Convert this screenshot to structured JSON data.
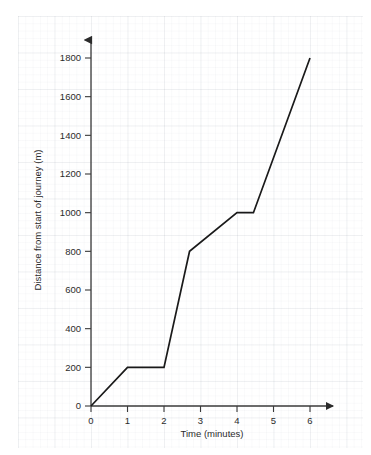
{
  "chart_data": {
    "type": "line",
    "title": "",
    "xlabel": "Time (minutes)",
    "ylabel": "Distance from start of journey (m)",
    "xlim": [
      0,
      6
    ],
    "ylim": [
      0,
      1800
    ],
    "grid": true,
    "legend": "none",
    "xticks": [
      0,
      1,
      2,
      3,
      4,
      5,
      6
    ],
    "xtick_labels": [
      "0",
      "1",
      "2",
      "3",
      "4",
      "5",
      "6"
    ],
    "yticks": [
      0,
      200,
      400,
      600,
      800,
      1000,
      1200,
      1400,
      1600,
      1800
    ],
    "ytick_labels": [
      "0",
      "200",
      "400",
      "600",
      "800",
      "1000",
      "1200",
      "1400",
      "1600",
      "1800"
    ],
    "series": [
      {
        "name": "journey",
        "color": "#1a1a1a",
        "x": [
          0,
          1,
          2,
          2.7,
          4,
          4.45,
          6
        ],
        "y": [
          0,
          200,
          200,
          800,
          1000,
          1000,
          1800
        ]
      }
    ]
  },
  "axes": {
    "x_arrow": "arrow-right-icon",
    "y_arrow": "arrow-up-icon",
    "axis_color": "#3a3a3a"
  }
}
